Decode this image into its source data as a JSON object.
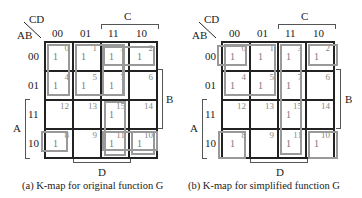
{
  "maps": [
    {
      "id": "a",
      "corner_top": "CD",
      "corner_left": "AB",
      "col_labels": [
        "00",
        "01",
        "11",
        "10"
      ],
      "row_labels": [
        "00",
        "01",
        "11",
        "10"
      ],
      "label_C": "C",
      "label_B": "B",
      "label_A": "A",
      "label_D": "D",
      "cells": [
        [
          {
            "idx": "0",
            "val": "1"
          },
          {
            "idx": "1",
            "val": "1"
          },
          {
            "idx": "3",
            "val": "1"
          },
          {
            "idx": "2",
            "val": "1"
          }
        ],
        [
          {
            "idx": "4",
            "val": "1"
          },
          {
            "idx": "5",
            "val": "1"
          },
          {
            "idx": "7",
            "val": "1"
          },
          {
            "idx": "6",
            "val": ""
          }
        ],
        [
          {
            "idx": "12",
            "val": ""
          },
          {
            "idx": "13",
            "val": ""
          },
          {
            "idx": "15",
            "val": "1"
          },
          {
            "idx": "14",
            "val": ""
          }
        ],
        [
          {
            "idx": "8",
            "val": "1"
          },
          {
            "idx": "9",
            "val": ""
          },
          {
            "idx": "11",
            "val": "1"
          },
          {
            "idx": "10",
            "val": "1"
          }
        ]
      ],
      "caption": "(a) K-map for original function G"
    },
    {
      "id": "b",
      "corner_top": "CD",
      "corner_left": "AB",
      "col_labels": [
        "00",
        "01",
        "11",
        "10"
      ],
      "row_labels": [
        "00",
        "01",
        "11",
        "10"
      ],
      "label_C": "C",
      "label_B": "B",
      "label_A": "A",
      "label_D": "D",
      "cells": [
        [
          {
            "idx": "0",
            "val": "1"
          },
          {
            "idx": "1",
            "val": "1"
          },
          {
            "idx": "3",
            "val": "1"
          },
          {
            "idx": "2",
            "val": "1"
          }
        ],
        [
          {
            "idx": "4",
            "val": "1"
          },
          {
            "idx": "5",
            "val": "1"
          },
          {
            "idx": "7",
            "val": "1"
          },
          {
            "idx": "6",
            "val": ""
          }
        ],
        [
          {
            "idx": "12",
            "val": ""
          },
          {
            "idx": "13",
            "val": ""
          },
          {
            "idx": "15",
            "val": "1"
          },
          {
            "idx": "14",
            "val": ""
          }
        ],
        [
          {
            "idx": "8",
            "val": "1"
          },
          {
            "idx": "9",
            "val": ""
          },
          {
            "idx": "11",
            "val": "1"
          },
          {
            "idx": "10",
            "val": "1"
          }
        ]
      ],
      "caption": "(b) K-map for simplified function G"
    }
  ]
}
